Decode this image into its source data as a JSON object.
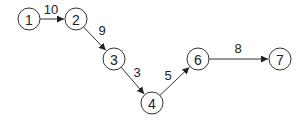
{
  "diagram": {
    "type": "directed-graph",
    "nodes": [
      {
        "id": "1",
        "label": "1",
        "x": 29,
        "y": 19
      },
      {
        "id": "2",
        "label": "2",
        "x": 76,
        "y": 19
      },
      {
        "id": "3",
        "label": "3",
        "x": 114,
        "y": 59
      },
      {
        "id": "4",
        "label": "4",
        "x": 152,
        "y": 103
      },
      {
        "id": "6",
        "label": "6",
        "x": 198,
        "y": 59
      },
      {
        "id": "7",
        "label": "7",
        "x": 280,
        "y": 59
      }
    ],
    "edges": [
      {
        "from": "1",
        "to": "2",
        "weight": "10",
        "lx": 51,
        "ly": 14
      },
      {
        "from": "2",
        "to": "3",
        "weight": "9",
        "lx": 102,
        "ly": 35
      },
      {
        "from": "3",
        "to": "4",
        "weight": "3",
        "lx": 137,
        "ly": 77
      },
      {
        "from": "4",
        "to": "6",
        "weight": "5",
        "lx": 168,
        "ly": 80
      },
      {
        "from": "6",
        "to": "7",
        "weight": "8",
        "lx": 238,
        "ly": 53
      }
    ],
    "node_radius": 11,
    "colors": {
      "stroke": "#333333",
      "text": "#222222",
      "background": "#ffffff"
    }
  }
}
